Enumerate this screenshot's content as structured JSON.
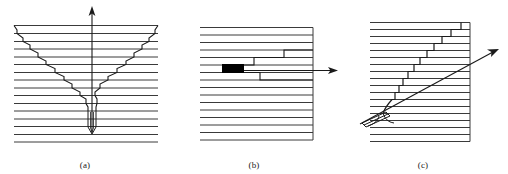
{
  "figure": {
    "title": "",
    "background_color": "#ffffff",
    "line_color": "#2b2b2b",
    "accent_color": "#000000",
    "width": 508,
    "height": 174
  },
  "panels": [
    {
      "id": "a",
      "caption": "(a)",
      "description": "v-shaped stepped crack front descending to a narrow tip with a vertical arrow pointing up",
      "icon": "v-crack-icon",
      "field": {
        "x": 14,
        "x_end": 158,
        "y_top": 25,
        "y_bottom": 143,
        "line_count": 16,
        "line_spacing": 7.87
      },
      "arrow": {
        "name": "up-arrow",
        "x": 92,
        "y_tail": 130,
        "y_head": 8,
        "direction": "up"
      }
    },
    {
      "id": "b",
      "caption": "(b)",
      "description": "horizontal layered field with a dark rectangular inclusion and stepped crack running rightward to an arrow",
      "icon": "lateral-crack-icon",
      "field": {
        "x": 200,
        "x_end": 313,
        "y_top": 27,
        "y_bottom": 143,
        "line_count": 16,
        "line_spacing": 7.73
      },
      "inclusion": {
        "name": "dark-inclusion",
        "x": 232,
        "y": 68,
        "width": 22,
        "height": 9,
        "color": "#000000"
      },
      "arrow": {
        "name": "right-arrow",
        "x_tail": 270,
        "x_head": 336,
        "y": 73,
        "direction": "right"
      }
    },
    {
      "id": "c",
      "caption": "(c)",
      "description": "staircase crack rising to the upper right with a diagonal arrow emerging from a wedge at lower left",
      "icon": "staircase-crack-icon",
      "field": {
        "x": 370,
        "x_end": 470,
        "y_top": 22,
        "y_bottom": 143,
        "line_count": 17,
        "line_spacing": 7.1
      },
      "arrow": {
        "name": "diagonal-arrow",
        "x_tail": 396,
        "y_tail": 118,
        "x_head": 500,
        "y_head": 60,
        "direction": "up-right"
      }
    }
  ]
}
